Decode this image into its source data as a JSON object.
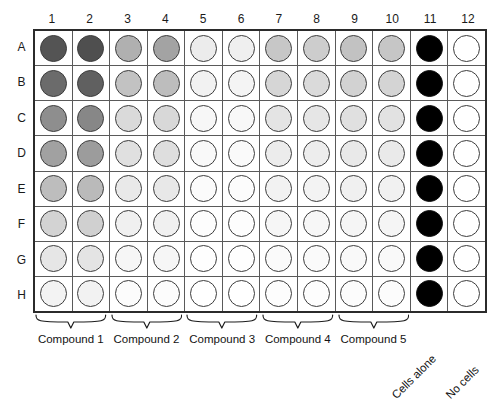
{
  "plate": {
    "rows": 8,
    "columns": 12,
    "column_headers": [
      "1",
      "2",
      "3",
      "4",
      "5",
      "6",
      "7",
      "8",
      "9",
      "10",
      "11",
      "12"
    ],
    "row_headers": [
      "A",
      "B",
      "C",
      "D",
      "E",
      "F",
      "G",
      "H"
    ],
    "border_color": "#2b2b2b",
    "grid_color": "#5a5a5a",
    "well_outline_color": "#3d3d3d"
  },
  "groups": [
    {
      "label": "Compound 1",
      "columns": [
        "1",
        "2"
      ],
      "start_col": 1,
      "span": 2
    },
    {
      "label": "Compound 2",
      "columns": [
        "3",
        "4"
      ],
      "start_col": 3,
      "span": 2
    },
    {
      "label": "Compound 3",
      "columns": [
        "5",
        "6"
      ],
      "start_col": 5,
      "span": 2
    },
    {
      "label": "Compound 4",
      "columns": [
        "7",
        "8"
      ],
      "start_col": 7,
      "span": 2
    },
    {
      "label": "Compound 5",
      "columns": [
        "9",
        "10"
      ],
      "start_col": 9,
      "span": 2
    }
  ],
  "controls": [
    {
      "label": "Cells alone",
      "column": "11",
      "fill": "#000000"
    },
    {
      "label": "No cells",
      "column": "12",
      "fill": "#ffffff"
    }
  ],
  "chart_data": {
    "type": "heatmap",
    "xlabel": "Column",
    "ylabel": "Row",
    "categories": [
      "1",
      "2",
      "3",
      "4",
      "5",
      "6",
      "7",
      "8",
      "9",
      "10",
      "11",
      "12"
    ],
    "row_categories": [
      "A",
      "B",
      "C",
      "D",
      "E",
      "F",
      "G",
      "H"
    ],
    "colorscale": "grayscale: dark = high signal, white = no signal",
    "grid": true,
    "legend": "none",
    "annotations": [
      "Columns 1-2: Compound 1",
      "Columns 3-4: Compound 2",
      "Columns 5-6: Compound 3",
      "Columns 7-8: Compound 4",
      "Columns 9-10: Compound 5",
      "Column 11: Cells alone",
      "Column 12: No cells"
    ],
    "well_fills": [
      [
        "#545454",
        "#4f4f4f",
        "#b0b0b0",
        "#a3a3a3",
        "#ececec",
        "#efefef",
        "#c7c7c7",
        "#cdcdcd",
        "#c2c2c2",
        "#c6c6c6",
        "#000000",
        "#ffffff"
      ],
      [
        "#6b6b6b",
        "#606060",
        "#c2c2c2",
        "#bdbdbd",
        "#f2f2f2",
        "#f4f4f4",
        "#d6d6d6",
        "#dadada",
        "#d2d2d2",
        "#d4d4d4",
        "#000000",
        "#ffffff"
      ],
      [
        "#8e8e8e",
        "#878787",
        "#dadada",
        "#d8d8d8",
        "#f7f7f7",
        "#f8f8f8",
        "#e4e4e4",
        "#e6e6e6",
        "#e0e0e0",
        "#e2e2e2",
        "#000000",
        "#ffffff"
      ],
      [
        "#a1a1a1",
        "#9c9c9c",
        "#e0e0e0",
        "#dedede",
        "#f9f9f9",
        "#fafafa",
        "#ececec",
        "#ededed",
        "#e9e9e9",
        "#eaeaea",
        "#000000",
        "#ffffff"
      ],
      [
        "#bdbdbd",
        "#bababa",
        "#e9e9e9",
        "#e8e8e8",
        "#fbfbfb",
        "#fcfcfc",
        "#f2f2f2",
        "#f3f3f3",
        "#f0f0f0",
        "#f1f1f1",
        "#000000",
        "#ffffff"
      ],
      [
        "#d3d3d3",
        "#d0d0d0",
        "#f0f0f0",
        "#f0f0f0",
        "#fdfdfd",
        "#fdfdfd",
        "#f6f6f6",
        "#f7f7f7",
        "#f5f5f5",
        "#f5f5f5",
        "#000000",
        "#ffffff"
      ],
      [
        "#e6e6e6",
        "#e4e4e4",
        "#f6f6f6",
        "#f6f6f6",
        "#fefefe",
        "#fefefe",
        "#fafafa",
        "#fafafa",
        "#f9f9f9",
        "#f9f9f9",
        "#000000",
        "#ffffff"
      ],
      [
        "#f3f3f3",
        "#f2f2f2",
        "#fcfcfc",
        "#fcfcfc",
        "#ffffff",
        "#ffffff",
        "#fdfdfd",
        "#fdfdfd",
        "#fcfcfc",
        "#fcfcfc",
        "#000000",
        "#ffffff"
      ]
    ],
    "intensity_values": [
      [
        67,
        69,
        31,
        36,
        7,
        6,
        22,
        20,
        24,
        22,
        100,
        0
      ],
      [
        58,
        62,
        24,
        26,
        5,
        4,
        16,
        15,
        18,
        17,
        100,
        0
      ],
      [
        44,
        47,
        15,
        15,
        3,
        3,
        11,
        10,
        12,
        12,
        100,
        0
      ],
      [
        37,
        39,
        12,
        13,
        2,
        2,
        8,
        7,
        9,
        8,
        100,
        0
      ],
      [
        26,
        27,
        9,
        9,
        2,
        1,
        5,
        5,
        6,
        6,
        100,
        0
      ],
      [
        17,
        18,
        6,
        6,
        1,
        1,
        4,
        3,
        4,
        4,
        100,
        0
      ],
      [
        10,
        11,
        4,
        4,
        1,
        1,
        2,
        2,
        2,
        2,
        100,
        0
      ],
      [
        5,
        5,
        1,
        1,
        0,
        0,
        1,
        1,
        1,
        1,
        100,
        0
      ]
    ]
  }
}
